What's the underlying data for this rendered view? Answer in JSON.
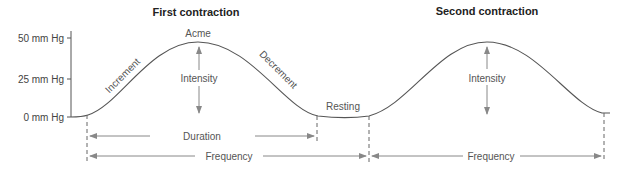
{
  "titles": {
    "first": "First contraction",
    "second": "Second contraction"
  },
  "y_axis": {
    "ticks": [
      "50 mm Hg",
      "25 mm Hg",
      "0 mm Hg"
    ]
  },
  "labels": {
    "acme": "Acme",
    "increment": "Increment",
    "decrement": "Decrement",
    "intensity_1": "Intensity",
    "intensity_2": "Intensity",
    "resting": "Resting",
    "duration": "Duration",
    "frequency_1": "Frequency",
    "frequency_2": "Frequency"
  },
  "colors": {
    "curve": "#555555",
    "arrows": "#888888",
    "text": "#555555"
  }
}
